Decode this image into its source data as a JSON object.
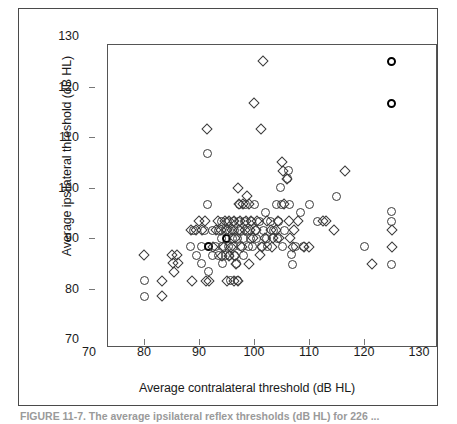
{
  "figure": {
    "caption": "FIGURE 11-7. The average ipsilateral reflex thresholds (dB HL) for 226 ...",
    "axis_color": "#555555",
    "marker_color": "#3a3a3a"
  },
  "chart_data": {
    "type": "scatter",
    "title": "",
    "xlabel": "Average contralateral threshold (dB HL)",
    "ylabel": "Average ipsilateral threshold (dB HL)",
    "xlim": [
      70,
      130
    ],
    "ylim": [
      70,
      130
    ],
    "xticks": [
      70,
      80,
      90,
      100,
      110,
      120,
      130
    ],
    "yticks": [
      70,
      80,
      90,
      100,
      110,
      120,
      130
    ],
    "grid": false,
    "legend": "none",
    "series": [
      {
        "name": "circle",
        "marker": "circle",
        "points": [
          [
            80.0,
            81.5
          ],
          [
            80.0,
            78.5
          ],
          [
            88.5,
            88.3
          ],
          [
            89.0,
            91.5
          ],
          [
            89.5,
            86.5
          ],
          [
            90.5,
            88.3
          ],
          [
            90.5,
            85.0
          ],
          [
            91.0,
            91.5
          ],
          [
            91.5,
            96.7
          ],
          [
            91.5,
            106.7
          ],
          [
            91.7,
            88.3
          ],
          [
            91.7,
            83.3
          ],
          [
            92.5,
            91.5
          ],
          [
            92.5,
            86.5
          ],
          [
            93.0,
            88.3
          ],
          [
            93.5,
            91.5
          ],
          [
            93.5,
            86.5
          ],
          [
            94.0,
            90.0
          ],
          [
            94.0,
            93.3
          ],
          [
            94.3,
            88.3
          ],
          [
            94.3,
            85.0
          ],
          [
            94.8,
            91.5
          ],
          [
            94.8,
            86.5
          ],
          [
            95.0,
            90.0
          ],
          [
            95.2,
            93.3
          ],
          [
            95.3,
            88.3
          ],
          [
            95.5,
            91.5
          ],
          [
            95.5,
            86.5
          ],
          [
            95.8,
            81.5
          ],
          [
            96.0,
            90.0
          ],
          [
            96.2,
            93.3
          ],
          [
            96.3,
            88.3
          ],
          [
            96.5,
            91.5
          ],
          [
            96.5,
            86.5
          ],
          [
            96.8,
            85.0
          ],
          [
            97.0,
            90.0
          ],
          [
            97.0,
            81.5
          ],
          [
            97.2,
            93.3
          ],
          [
            97.3,
            96.7
          ],
          [
            97.5,
            88.3
          ],
          [
            97.5,
            91.5
          ],
          [
            98.0,
            90.0
          ],
          [
            98.0,
            86.5
          ],
          [
            98.3,
            93.3
          ],
          [
            98.5,
            96.7
          ],
          [
            98.8,
            91.5
          ],
          [
            99.0,
            88.3
          ],
          [
            99.3,
            90.0
          ],
          [
            99.5,
            93.3
          ],
          [
            99.8,
            88.3
          ],
          [
            100.0,
            96.7
          ],
          [
            100.2,
            91.5
          ],
          [
            100.5,
            90.0
          ],
          [
            101.0,
            93.3
          ],
          [
            101.3,
            88.3
          ],
          [
            101.8,
            91.5
          ],
          [
            102.0,
            95.0
          ],
          [
            102.3,
            90.0
          ],
          [
            102.5,
            88.3
          ],
          [
            103.0,
            93.3
          ],
          [
            103.5,
            91.5
          ],
          [
            104.0,
            96.7
          ],
          [
            104.3,
            90.0
          ],
          [
            104.5,
            93.3
          ],
          [
            104.8,
            100.0
          ],
          [
            105.0,
            96.7
          ],
          [
            105.2,
            88.3
          ],
          [
            105.5,
            91.5
          ],
          [
            106.0,
            101.7
          ],
          [
            106.2,
            103.3
          ],
          [
            106.5,
            96.7
          ],
          [
            106.8,
            86.7
          ],
          [
            107.0,
            84.8
          ],
          [
            107.5,
            88.3
          ],
          [
            108.5,
            95.0
          ],
          [
            109.0,
            88.3
          ],
          [
            110.0,
            96.7
          ],
          [
            111.5,
            93.3
          ],
          [
            115.0,
            98.3
          ],
          [
            120.0,
            88.3
          ],
          [
            125.0,
            95.3
          ],
          [
            125.0,
            93.3
          ],
          [
            125.0,
            84.8
          ],
          [
            125.0,
            125.0
          ],
          [
            125.0,
            116.7
          ]
        ],
        "bold_points": [
          [
            125.0,
            125.0
          ],
          [
            125.0,
            116.7
          ],
          [
            91.7,
            88.3
          ],
          [
            95.0,
            90.0
          ],
          [
            96.8,
            86.5
          ],
          [
            100.0,
            88.3
          ]
        ]
      },
      {
        "name": "diamond",
        "marker": "diamond",
        "points": [
          [
            80.0,
            86.7
          ],
          [
            83.3,
            81.5
          ],
          [
            83.3,
            78.5
          ],
          [
            85.0,
            86.7
          ],
          [
            85.2,
            85.0
          ],
          [
            85.5,
            83.3
          ],
          [
            86.0,
            86.7
          ],
          [
            86.2,
            85.0
          ],
          [
            88.8,
            81.5
          ],
          [
            88.5,
            91.5
          ],
          [
            89.5,
            91.5
          ],
          [
            90.0,
            93.3
          ],
          [
            90.5,
            91.5
          ],
          [
            91.0,
            93.3
          ],
          [
            91.3,
            81.5
          ],
          [
            91.5,
            111.5
          ],
          [
            91.8,
            81.5
          ],
          [
            92.5,
            88.3
          ],
          [
            93.0,
            91.5
          ],
          [
            93.5,
            93.3
          ],
          [
            94.0,
            91.5
          ],
          [
            94.2,
            86.5
          ],
          [
            94.5,
            88.3
          ],
          [
            94.8,
            93.3
          ],
          [
            95.0,
            91.5
          ],
          [
            95.0,
            81.5
          ],
          [
            95.5,
            93.3
          ],
          [
            95.5,
            86.5
          ],
          [
            95.8,
            88.3
          ],
          [
            96.0,
            91.5
          ],
          [
            96.3,
            93.3
          ],
          [
            96.3,
            81.5
          ],
          [
            96.5,
            90.0
          ],
          [
            96.5,
            86.5
          ],
          [
            96.8,
            84.8
          ],
          [
            97.0,
            100.0
          ],
          [
            97.0,
            81.5
          ],
          [
            97.2,
            91.5
          ],
          [
            97.3,
            96.7
          ],
          [
            97.5,
            93.3
          ],
          [
            97.8,
            88.3
          ],
          [
            98.0,
            96.7
          ],
          [
            98.3,
            91.5
          ],
          [
            98.5,
            93.3
          ],
          [
            98.8,
            98.3
          ],
          [
            99.0,
            96.7
          ],
          [
            99.0,
            84.8
          ],
          [
            99.3,
            91.5
          ],
          [
            99.5,
            93.3
          ],
          [
            99.8,
            90.0
          ],
          [
            100.0,
            116.7
          ],
          [
            100.3,
            91.5
          ],
          [
            100.5,
            93.3
          ],
          [
            101.0,
            86.7
          ],
          [
            101.3,
            111.5
          ],
          [
            101.5,
            88.3
          ],
          [
            101.7,
            125.0
          ],
          [
            102.0,
            90.0
          ],
          [
            102.3,
            93.3
          ],
          [
            103.0,
            91.5
          ],
          [
            103.3,
            88.3
          ],
          [
            103.5,
            90.0
          ],
          [
            104.0,
            91.5
          ],
          [
            104.3,
            93.3
          ],
          [
            104.5,
            90.0
          ],
          [
            105.0,
            105.0
          ],
          [
            105.2,
            103.3
          ],
          [
            105.5,
            96.7
          ],
          [
            106.0,
            101.7
          ],
          [
            106.3,
            93.3
          ],
          [
            106.5,
            90.0
          ],
          [
            107.0,
            88.3
          ],
          [
            107.3,
            91.5
          ],
          [
            108.0,
            93.3
          ],
          [
            109.0,
            88.3
          ],
          [
            110.0,
            88.3
          ],
          [
            112.5,
            93.3
          ],
          [
            113.0,
            93.3
          ],
          [
            114.5,
            91.5
          ],
          [
            116.5,
            103.3
          ],
          [
            121.5,
            84.8
          ],
          [
            125.0,
            91.5
          ],
          [
            125.0,
            88.3
          ]
        ],
        "bold_points": [
          [
            96.5,
            91.5
          ]
        ]
      }
    ]
  }
}
